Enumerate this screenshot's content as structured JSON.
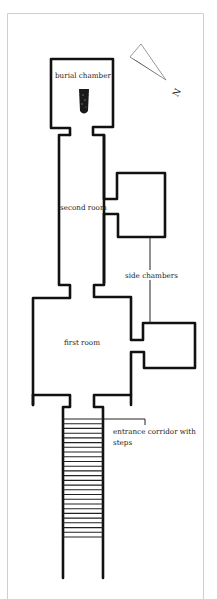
{
  "diagram": {
    "type": "floor-plan",
    "compass": {
      "label": "N",
      "icon": "north-arrow-icon"
    },
    "labels": {
      "burial_chamber": "burial chamber",
      "second_room": "second room",
      "side_chambers": "side chambers",
      "first_room": "first room",
      "entrance_line1": "entrance corridor with",
      "entrance_line2": "steps"
    },
    "rooms": [
      {
        "name": "burial chamber",
        "contains": "sarcophagus"
      },
      {
        "name": "second room"
      },
      {
        "name": "side chamber (upper)"
      },
      {
        "name": "first room"
      },
      {
        "name": "side chamber (lower)"
      },
      {
        "name": "entrance corridor with steps",
        "step_count": 26
      }
    ],
    "colors": {
      "wall": "#111111",
      "frame": "#cfcfcf",
      "background": "#ffffff"
    }
  }
}
